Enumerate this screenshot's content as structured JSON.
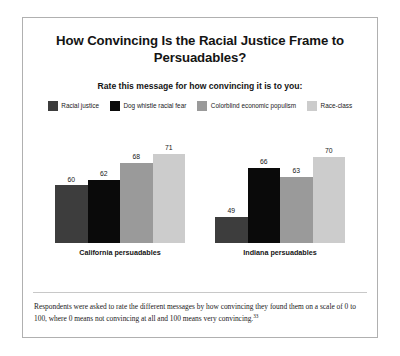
{
  "figure": {
    "title": "How Convincing Is the Racial Justice Frame to Persuadables?",
    "subtitle": "Rate this message for how convincing it is to you:",
    "footnote": "Respondents were asked to rate the different messages by how convincing they found them on a scale of 0 to 100, where 0 means not convincing at all and 100 means very convincing.",
    "footnote_marker": "33",
    "border_color": "#b0b0b0",
    "background": "#ffffff"
  },
  "chart_data": {
    "type": "bar",
    "title": "How Convincing Is the Racial Justice Frame to Persuadables?",
    "subtitle": "Rate this message for how convincing it is to you:",
    "xlabel": "",
    "ylabel": "",
    "ylim": [
      40,
      78
    ],
    "grid": false,
    "legend_position": "top",
    "categories": [
      "California persuadables",
      "Indiana persuadables"
    ],
    "series": [
      {
        "name": "Racial justice",
        "color": "#3d3d3d",
        "values": [
          60,
          62
        ]
      },
      {
        "name": "Dog whistle racial fear",
        "color": "#0a0a0a",
        "values": [
          62,
          66
        ]
      },
      {
        "name": "Colorblind economic populism",
        "color": "#9a9a9a",
        "values": [
          68,
          63
        ]
      },
      {
        "name": "Race-class",
        "color": "#cccccc",
        "values": [
          71,
          70
        ]
      }
    ],
    "groups": [
      {
        "label": "California persuadables",
        "bars": [
          {
            "series": "Racial justice",
            "value": 60,
            "color": "#3d3d3d"
          },
          {
            "series": "Dog whistle racial fear",
            "value": 62,
            "color": "#0a0a0a"
          },
          {
            "series": "Colorblind economic populism",
            "value": 68,
            "color": "#9a9a9a"
          },
          {
            "series": "Race-class",
            "value": 71,
            "color": "#cccccc"
          }
        ]
      },
      {
        "label": "Indiana persuadables",
        "bars": [
          {
            "series": "Racial justice",
            "value": 49,
            "color": "#3d3d3d"
          },
          {
            "series": "Dog whistle racial fear",
            "value": 66,
            "color": "#0a0a0a"
          },
          {
            "series": "Colorblind economic populism",
            "value": 63,
            "color": "#9a9a9a"
          },
          {
            "series": "Race-class",
            "value": 70,
            "color": "#cccccc"
          }
        ]
      }
    ]
  }
}
